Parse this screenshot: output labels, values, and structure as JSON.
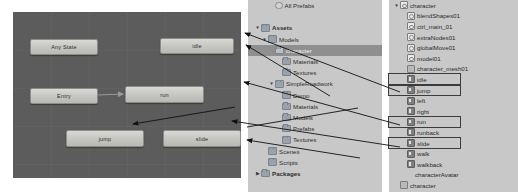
{
  "animator": {
    "name": "animator-state-machine",
    "background_color": "#5c5c5c",
    "nodes": [
      {
        "id": "any-state",
        "label": "Any State",
        "x": 17,
        "y": 27,
        "w": 66,
        "h": 14
      },
      {
        "id": "idle",
        "label": "idle",
        "x": 147,
        "y": 26,
        "w": 72,
        "h": 14
      },
      {
        "id": "entry",
        "label": "Entry",
        "x": 17,
        "y": 76,
        "w": 66,
        "h": 14
      },
      {
        "id": "run",
        "label": "run",
        "x": 112,
        "y": 74,
        "w": 77,
        "h": 15
      },
      {
        "id": "jump",
        "label": "jump",
        "x": 53,
        "y": 118,
        "w": 76,
        "h": 15
      },
      {
        "id": "slide",
        "label": "slide",
        "x": 150,
        "y": 118,
        "w": 76,
        "h": 15
      }
    ],
    "transitions": [
      {
        "from": "entry",
        "to": "run"
      },
      {
        "from": "slide",
        "to": "jump"
      }
    ]
  },
  "project_panel": {
    "name": "project-tree",
    "rows": [
      {
        "label": "All Prefabs",
        "indent": 2,
        "icon": "prefab-icon",
        "twisty": "",
        "bold": false,
        "selected": false
      },
      {
        "label": "",
        "indent": 0,
        "icon": "none",
        "twisty": "",
        "bold": false,
        "selected": false
      },
      {
        "label": "Assets",
        "indent": 0,
        "icon": "folder-icon",
        "twisty": "▼",
        "bold": true,
        "selected": false
      },
      {
        "label": "Models",
        "indent": 1,
        "icon": "folder-icon",
        "twisty": "▼",
        "bold": false,
        "selected": false
      },
      {
        "label": "character",
        "indent": 2,
        "icon": "folder-icon",
        "twisty": "",
        "bold": false,
        "selected": true
      },
      {
        "label": "Materials",
        "indent": 3,
        "icon": "folder-icon",
        "twisty": "",
        "bold": false,
        "selected": false
      },
      {
        "label": "Textures",
        "indent": 3,
        "icon": "folder-icon",
        "twisty": "",
        "bold": false,
        "selected": false
      },
      {
        "label": "SimpleRoadwork",
        "indent": 2,
        "icon": "folder-icon",
        "twisty": "▼",
        "bold": false,
        "selected": false
      },
      {
        "label": "Demo",
        "indent": 3,
        "icon": "folder-icon",
        "twisty": "",
        "bold": false,
        "selected": false
      },
      {
        "label": "Materials",
        "indent": 3,
        "icon": "folder-icon",
        "twisty": "",
        "bold": false,
        "selected": false
      },
      {
        "label": "Models",
        "indent": 3,
        "icon": "folder-icon",
        "twisty": "",
        "bold": false,
        "selected": false
      },
      {
        "label": "Prefabs",
        "indent": 3,
        "icon": "folder-icon",
        "twisty": "",
        "bold": false,
        "selected": false
      },
      {
        "label": "Textures",
        "indent": 3,
        "icon": "folder-icon",
        "twisty": "",
        "bold": false,
        "selected": false
      },
      {
        "label": "Scenes",
        "indent": 1,
        "icon": "folder-icon",
        "twisty": "",
        "bold": false,
        "selected": false
      },
      {
        "label": "Scripts",
        "indent": 1,
        "icon": "folder-icon",
        "twisty": "",
        "bold": false,
        "selected": false
      },
      {
        "label": "Packages",
        "indent": 0,
        "icon": "folder-icon",
        "twisty": "▶",
        "bold": true,
        "selected": false
      }
    ]
  },
  "hierarchy_panel": {
    "name": "model-import-hierarchy",
    "rows": [
      {
        "label": "character",
        "indent": 0,
        "icon": "node-icon",
        "twisty": "▼",
        "boxed": false
      },
      {
        "label": "blendShapes01",
        "indent": 1,
        "icon": "node-icon",
        "twisty": "",
        "boxed": false
      },
      {
        "label": "ctrl_main_01",
        "indent": 1,
        "icon": "node-icon",
        "twisty": "",
        "boxed": false
      },
      {
        "label": "extraNodes01",
        "indent": 1,
        "icon": "node-icon",
        "twisty": "",
        "boxed": false
      },
      {
        "label": "globalMove01",
        "indent": 1,
        "icon": "node-icon",
        "twisty": "",
        "boxed": false
      },
      {
        "label": "model01",
        "indent": 1,
        "icon": "node-icon",
        "twisty": "",
        "boxed": false
      },
      {
        "label": "character_mesh01",
        "indent": 1,
        "icon": "mesh-icon",
        "twisty": "",
        "boxed": false
      },
      {
        "label": "idle",
        "indent": 1,
        "icon": "clip-icon",
        "twisty": "",
        "boxed": true
      },
      {
        "label": "jump",
        "indent": 1,
        "icon": "clip-icon",
        "twisty": "",
        "boxed": true
      },
      {
        "label": "left",
        "indent": 1,
        "icon": "clip-icon",
        "twisty": "",
        "boxed": false
      },
      {
        "label": "right",
        "indent": 1,
        "icon": "clip-icon",
        "twisty": "",
        "boxed": false
      },
      {
        "label": "run",
        "indent": 1,
        "icon": "clip-icon",
        "twisty": "",
        "boxed": true
      },
      {
        "label": "runback",
        "indent": 1,
        "icon": "clip-icon",
        "twisty": "",
        "boxed": false
      },
      {
        "label": "slide",
        "indent": 1,
        "icon": "clip-icon",
        "twisty": "",
        "boxed": true
      },
      {
        "label": "walk",
        "indent": 1,
        "icon": "clip-icon",
        "twisty": "",
        "boxed": false
      },
      {
        "label": "walkback",
        "indent": 1,
        "icon": "clip-icon",
        "twisty": "",
        "boxed": false
      },
      {
        "label": "characterAvatar",
        "indent": 1,
        "icon": "avatar-icon",
        "twisty": "",
        "boxed": false
      },
      {
        "label": "character",
        "indent": 0,
        "icon": "mesh-icon",
        "twisty": "",
        "boxed": false
      }
    ]
  },
  "annotations": {
    "name": "annotation-arrows",
    "color": "#1a1a1a",
    "arrows": [
      {
        "id": "idle-to-idle-node",
        "from_label": "idle",
        "to_label": "idle"
      },
      {
        "id": "run-to-run-node",
        "from_label": "run",
        "to_label": "run"
      },
      {
        "id": "slide-to-slide-node",
        "from_label": "slide",
        "to_label": "slide"
      },
      {
        "id": "jump-to-jump-node",
        "from_label": "jump",
        "to_label": "jump"
      },
      {
        "id": "character-folder",
        "from_label": "character",
        "to_label": "character"
      }
    ]
  }
}
